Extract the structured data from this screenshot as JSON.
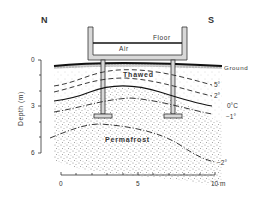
{
  "orientation": {
    "north": "N",
    "south": "S"
  },
  "building": {
    "floor_label": "Floor",
    "air_label": "Air"
  },
  "ground_label": "Ground",
  "zones": {
    "thawed": "Thawed",
    "permafrost": "Permafrost"
  },
  "isotherms": [
    {
      "label": "5°",
      "style": "dashed"
    },
    {
      "label": "2°",
      "style": "dashed"
    },
    {
      "label": "0°C",
      "style": "solid"
    },
    {
      "label": "−1°",
      "style": "dash-dot"
    },
    {
      "label": "−2°",
      "style": "dash-dot"
    }
  ],
  "depth_axis": {
    "title": "Depth (m)",
    "ticks": [
      "0",
      "3",
      "6"
    ]
  },
  "distance_axis": {
    "ticks": [
      "0",
      "5",
      "10 m"
    ]
  },
  "colors": {
    "line": "#222222",
    "stipple": "#8a8a8a",
    "building_fill": "#d8d8d8",
    "text": "#333333"
  }
}
